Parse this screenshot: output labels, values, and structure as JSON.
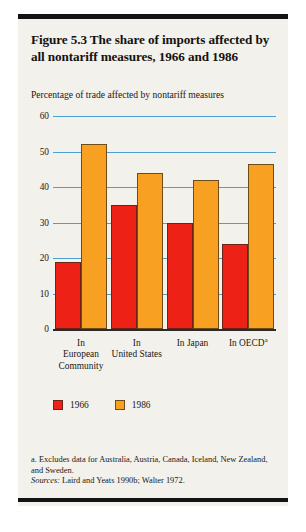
{
  "figure": {
    "title": "Figure 5.3  The share of imports affected by all nontariff measures, 1966 and 1986",
    "axis_caption": "Percentage of trade affected by nontariff measures",
    "footnote": "a. Excludes data for Australia, Austria, Canada, Iceland, New Zealand, and Sweden.",
    "sources_lead": "Sources:",
    "sources_text": " Laird and Yeats 1990b; Walter 1972."
  },
  "legend": {
    "items": [
      {
        "label": "1966",
        "color": "#ee2117"
      },
      {
        "label": "1986",
        "color": "#f8a021"
      }
    ]
  },
  "chart_data": {
    "type": "bar",
    "title": "Figure 5.3  The share of imports affected by all nontariff measures, 1966 and 1986",
    "xlabel": "",
    "ylabel": "Percentage of trade affected by nontariff measures",
    "ylim": [
      0,
      60
    ],
    "yticks": [
      0,
      10,
      20,
      30,
      40,
      50,
      60
    ],
    "grid": true,
    "legend_position": "bottom-left",
    "categories": [
      "In European Community",
      "In United States",
      "In Japan",
      "In OECD"
    ],
    "category_lines": [
      [
        "In",
        "European",
        "Community"
      ],
      [
        "In",
        "United States"
      ],
      [
        "In Japan"
      ],
      [
        "In OECD"
      ]
    ],
    "category_superscripts": [
      "",
      "",
      "",
      "a"
    ],
    "series": [
      {
        "name": "1966",
        "color": "#ee2117",
        "values": [
          19,
          35,
          30,
          24
        ]
      },
      {
        "name": "1986",
        "color": "#f8a021",
        "values": [
          52,
          44,
          42,
          46.5
        ]
      }
    ]
  }
}
